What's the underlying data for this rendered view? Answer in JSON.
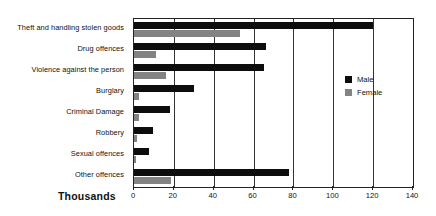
{
  "chart_data": {
    "type": "bar",
    "orientation": "horizontal",
    "title": "",
    "xlabel": "Thousands",
    "ylabel": "",
    "xlim": [
      0,
      140
    ],
    "xticks": [
      0,
      20,
      40,
      60,
      80,
      100,
      120,
      140
    ],
    "grid": true,
    "grid_axis": "x",
    "legend_position": "right",
    "categories": [
      "Theft and handling stolen goods",
      "Drug offences",
      "Violence against the person",
      "Burglary",
      "Criminal Damage",
      "Robbery",
      "Sexual offences",
      "Other offences"
    ],
    "series": [
      {
        "name": "Male",
        "color": "#0d0d0d",
        "values": [
          120,
          66,
          65,
          30,
          18,
          9.5,
          7.5,
          78
        ]
      },
      {
        "name": "Female",
        "color": "#838383",
        "values": [
          53,
          11,
          16,
          2.5,
          2.5,
          1.5,
          0.5,
          18.5
        ]
      }
    ]
  },
  "axis": {
    "x_title": "Thousands",
    "tick_labels": [
      "0",
      "20",
      "40",
      "60",
      "80",
      "100",
      "120",
      "140"
    ]
  },
  "legend": {
    "entries": [
      {
        "label": "Male",
        "color": "#0d0d0d"
      },
      {
        "label": "Female",
        "color": "#838383"
      }
    ]
  }
}
